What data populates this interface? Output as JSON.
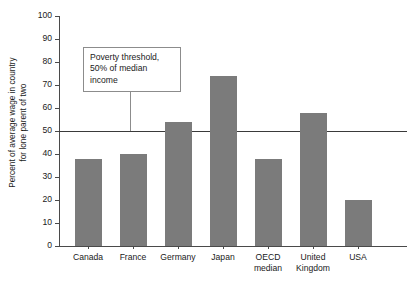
{
  "chart_data": {
    "type": "bar",
    "title": "",
    "xlabel": "",
    "ylabel_line1": "Percent of average wage in country",
    "ylabel_line2": "for lone parent of two",
    "categories": [
      "Canada",
      "France",
      "Germany",
      "Japan",
      "OECD median",
      "United Kingdom",
      "USA"
    ],
    "category_lines": [
      [
        "Canada"
      ],
      [
        "France"
      ],
      [
        "Germany"
      ],
      [
        "Japan"
      ],
      [
        "OECD",
        "median"
      ],
      [
        "United",
        "Kingdom"
      ],
      [
        "USA"
      ]
    ],
    "values": [
      38,
      40,
      54,
      74,
      38,
      58,
      20
    ],
    "ylim": [
      0,
      100
    ],
    "yticks": [
      0,
      10,
      20,
      30,
      40,
      50,
      60,
      70,
      80,
      90,
      100
    ],
    "ytick_labels": [
      "0",
      "10",
      "20",
      "30",
      "40",
      "50",
      "60",
      "70",
      "80",
      "90",
      "100"
    ],
    "grid": false,
    "legend": "none",
    "reference_line": {
      "value": 50,
      "label_line1": "Poverty threshold,",
      "label_line2": "50% of median",
      "label_line3": "income"
    },
    "colors": {
      "bar": "#7b7b7b",
      "axis": "#4a4a4a",
      "reference_line": "#3a3a3a",
      "annotation_border": "#8c8c8c",
      "background": "#ffffff",
      "text": "#1a1a1a"
    }
  }
}
